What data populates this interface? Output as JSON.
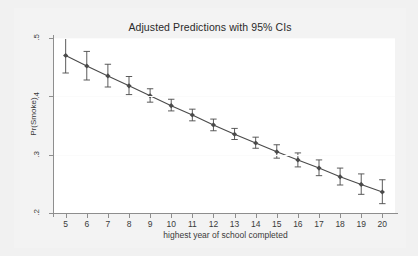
{
  "chart_data": {
    "type": "line",
    "title": "Adjusted Predictions with 95% CIs",
    "xlabel": "highest year of school completed",
    "ylabel": "Pr(Smoke)",
    "xlim": [
      4.4,
      20.6
    ],
    "ylim": [
      0.2,
      0.5
    ],
    "xticks": [
      5,
      6,
      7,
      8,
      9,
      10,
      11,
      12,
      13,
      14,
      15,
      16,
      17,
      18,
      19,
      20
    ],
    "xtick_labels": [
      "5",
      "6",
      "7",
      "8",
      "9",
      "10",
      "11",
      "12",
      "13",
      "14",
      "15",
      "16",
      "17",
      "18",
      "19",
      "20"
    ],
    "yticks": [
      0.2,
      0.3,
      0.4,
      0.5
    ],
    "ytick_labels": [
      ".2",
      ".3",
      ".4",
      ".5"
    ],
    "grid": true,
    "legend": "none",
    "series": [
      {
        "name": "Predicted Pr(Smoke)",
        "marker": "diamond",
        "color": "#4a4a4a",
        "x": [
          5,
          6,
          7,
          8,
          9,
          10,
          11,
          12,
          13,
          14,
          15,
          16,
          17,
          18,
          19,
          20
        ],
        "values": [
          0.47,
          0.452,
          0.435,
          0.418,
          0.401,
          0.384,
          0.368,
          0.351,
          0.335,
          0.32,
          0.305,
          0.291,
          0.277,
          0.262,
          0.249,
          0.236
        ],
        "ci_low": [
          0.44,
          0.428,
          0.416,
          0.403,
          0.39,
          0.375,
          0.358,
          0.341,
          0.326,
          0.311,
          0.294,
          0.279,
          0.264,
          0.248,
          0.232,
          0.216
        ],
        "ci_high": [
          0.5,
          0.477,
          0.455,
          0.434,
          0.413,
          0.395,
          0.378,
          0.361,
          0.345,
          0.33,
          0.317,
          0.303,
          0.291,
          0.277,
          0.267,
          0.257
        ]
      }
    ]
  },
  "axis_titles": {
    "x": "highest year of school completed",
    "y": "Pr(Smoke)"
  },
  "header": {
    "title": "Adjusted Predictions with 95% CIs"
  },
  "colors": {
    "background": "#f1f1f1",
    "plot_background": "#ffffff",
    "axis": "#8e8e8e",
    "series": "#4a4a4a",
    "text": "#3a3a3a",
    "grid": "#fbfbfb"
  }
}
